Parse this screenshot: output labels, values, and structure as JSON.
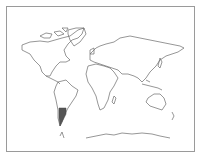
{
  "map": {
    "type": "world-outline",
    "projection": "equirectangular-like",
    "highlighted_region": "Argentina",
    "colors": {
      "background": "#ffffff",
      "frame": "#9a9a9a",
      "outline": "#6a6a6a",
      "highlight": "#555555"
    }
  }
}
